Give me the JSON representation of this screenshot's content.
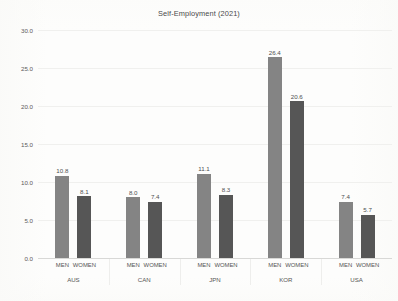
{
  "chart_data": {
    "type": "bar",
    "title": "Self-Employment (2021)",
    "subtitle": "",
    "xlabel": "",
    "ylabel": "",
    "ylim": [
      0.0,
      30.0
    ],
    "ytick_labels": [
      "0.0",
      "5.0",
      "10.0",
      "15.0",
      "20.0",
      "25.0",
      "30.0"
    ],
    "ytick_values": [
      0.0,
      5.0,
      10.0,
      15.0,
      20.0,
      25.0,
      30.0
    ],
    "grid": true,
    "legend": "none",
    "grouped": true,
    "group_label_name": "country",
    "series_label_name": "sex",
    "categories": [
      "AUS",
      "CAN",
      "JPN",
      "KOR",
      "USA"
    ],
    "series": [
      {
        "name": "MEN",
        "color": "#848484",
        "values": [
          10.8,
          8.0,
          11.1,
          26.4,
          7.4
        ]
      },
      {
        "name": "WOMEN",
        "color": "#565656",
        "values": [
          8.1,
          7.4,
          8.3,
          20.6,
          5.7
        ]
      }
    ],
    "bars": [
      {
        "group": "AUS",
        "series": "MEN",
        "value": 10.8,
        "label": "10.8",
        "color": "#848484"
      },
      {
        "group": "AUS",
        "series": "WOMEN",
        "value": 8.1,
        "label": "8.1",
        "color": "#565656"
      },
      {
        "group": "CAN",
        "series": "MEN",
        "value": 8.0,
        "label": "8.0",
        "color": "#848484"
      },
      {
        "group": "CAN",
        "series": "WOMEN",
        "value": 7.4,
        "label": "7.4",
        "color": "#565656"
      },
      {
        "group": "JPN",
        "series": "MEN",
        "value": 11.1,
        "label": "11.1",
        "color": "#848484"
      },
      {
        "group": "JPN",
        "series": "WOMEN",
        "value": 8.3,
        "label": "8.3",
        "color": "#565656"
      },
      {
        "group": "KOR",
        "series": "MEN",
        "value": 26.4,
        "label": "26.4",
        "color": "#848484"
      },
      {
        "group": "KOR",
        "series": "WOMEN",
        "value": 20.6,
        "label": "20.6",
        "color": "#565656"
      },
      {
        "group": "USA",
        "series": "MEN",
        "value": 7.4,
        "label": "7.4",
        "color": "#848484"
      },
      {
        "group": "USA",
        "series": "WOMEN",
        "value": 5.7,
        "label": "5.7",
        "color": "#565656"
      }
    ]
  }
}
